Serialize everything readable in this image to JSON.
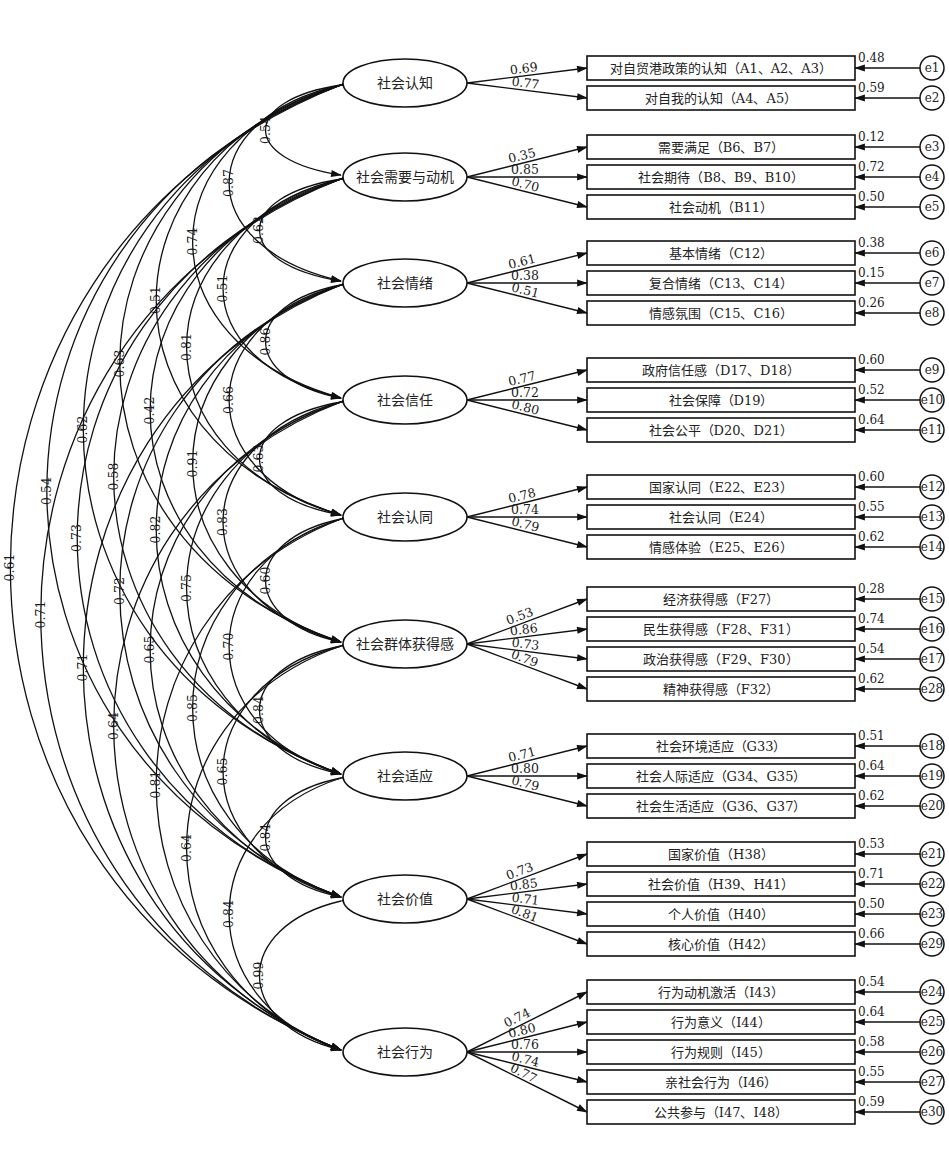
{
  "latent_factors": [
    {
      "id": "F1",
      "label": "社会认知"
    },
    {
      "id": "F2",
      "label": "社会需要与动机"
    },
    {
      "id": "F3",
      "label": "社会情绪"
    },
    {
      "id": "F4",
      "label": "社会信任"
    },
    {
      "id": "F5",
      "label": "社会认同"
    },
    {
      "id": "F6",
      "label": "社会群体获得感"
    },
    {
      "id": "F7",
      "label": "社会适应"
    },
    {
      "id": "F8",
      "label": "社会价值"
    },
    {
      "id": "F9",
      "label": "社会行为"
    }
  ],
  "indicators": [
    {
      "factor": "F1",
      "label": "对自贸港政策的认知（A1、A2、A3）",
      "loading": "0.69",
      "error": "e1",
      "error_value": "0.48"
    },
    {
      "factor": "F1",
      "label": "对自我的认知（A4、A5）",
      "loading": "0.77",
      "error": "e2",
      "error_value": "0.59"
    },
    {
      "factor": "F2",
      "label": "需要满足（B6、B7）",
      "loading": "0.35",
      "error": "e3",
      "error_value": "0.12"
    },
    {
      "factor": "F2",
      "label": "社会期待（B8、B9、B10）",
      "loading": "0.85",
      "error": "e4",
      "error_value": "0.72"
    },
    {
      "factor": "F2",
      "label": "社会动机（B11）",
      "loading": "0.70",
      "error": "e5",
      "error_value": "0.50"
    },
    {
      "factor": "F3",
      "label": "基本情绪（C12）",
      "loading": "0.61",
      "error": "e6",
      "error_value": "0.38"
    },
    {
      "factor": "F3",
      "label": "复合情绪（C13、C14）",
      "loading": "0.38",
      "error": "e7",
      "error_value": "0.15"
    },
    {
      "factor": "F3",
      "label": "情感氛围（C15、C16）",
      "loading": "0.51",
      "error": "e8",
      "error_value": "0.26"
    },
    {
      "factor": "F4",
      "label": "政府信任感（D17、D18）",
      "loading": "0.77",
      "error": "e9",
      "error_value": "0.60"
    },
    {
      "factor": "F4",
      "label": "社会保障（D19）",
      "loading": "0.72",
      "error": "e10",
      "error_value": "0.52"
    },
    {
      "factor": "F4",
      "label": "社会公平（D20、D21）",
      "loading": "0.80",
      "error": "e11",
      "error_value": "0.64"
    },
    {
      "factor": "F5",
      "label": "国家认同（E22、E23）",
      "loading": "0.78",
      "error": "e12",
      "error_value": "0.60"
    },
    {
      "factor": "F5",
      "label": "社会认同（E24）",
      "loading": "0.74",
      "error": "e13",
      "error_value": "0.55"
    },
    {
      "factor": "F5",
      "label": "情感体验（E25、E26）",
      "loading": "0.79",
      "error": "e14",
      "error_value": "0.62"
    },
    {
      "factor": "F6",
      "label": "经济获得感（F27）",
      "loading": "0.53",
      "error": "e15",
      "error_value": "0.28"
    },
    {
      "factor": "F6",
      "label": "民生获得感（F28、F31）",
      "loading": "0.86",
      "error": "e16",
      "error_value": "0.74"
    },
    {
      "factor": "F6",
      "label": "政治获得感（F29、F30）",
      "loading": "0.73",
      "error": "e17",
      "error_value": "0.54"
    },
    {
      "factor": "F6",
      "label": "精神获得感（F32）",
      "loading": "0.79",
      "error": "e28",
      "error_value": "0.62"
    },
    {
      "factor": "F7",
      "label": "社会环境适应（G33）",
      "loading": "0.71",
      "error": "e18",
      "error_value": "0.51"
    },
    {
      "factor": "F7",
      "label": "社会人际适应（G34、G35）",
      "loading": "0.80",
      "error": "e19",
      "error_value": "0.64"
    },
    {
      "factor": "F7",
      "label": "社会生活适应（G36、G37）",
      "loading": "0.79",
      "error": "e20",
      "error_value": "0.62"
    },
    {
      "factor": "F8",
      "label": "国家价值（H38）",
      "loading": "0.73",
      "error": "e21",
      "error_value": "0.53"
    },
    {
      "factor": "F8",
      "label": "社会价值（H39、H41）",
      "loading": "0.85",
      "error": "e22",
      "error_value": "0.71"
    },
    {
      "factor": "F8",
      "label": "个人价值（H40）",
      "loading": "0.71",
      "error": "e23",
      "error_value": "0.50"
    },
    {
      "factor": "F8",
      "label": "核心价值（H42）",
      "loading": "0.81",
      "error": "e29",
      "error_value": "0.66"
    },
    {
      "factor": "F9",
      "label": "行为动机激活（I43）",
      "loading": "0.74",
      "error": "e24",
      "error_value": "0.54"
    },
    {
      "factor": "F9",
      "label": "行为意义（I44）",
      "loading": "0.80",
      "error": "e25",
      "error_value": "0.64"
    },
    {
      "factor": "F9",
      "label": "行为规则（I45）",
      "loading": "0.76",
      "error": "e26",
      "error_value": "0.58"
    },
    {
      "factor": "F9",
      "label": "亲社会行为（I46）",
      "loading": "0.74",
      "error": "e27",
      "error_value": "0.55"
    },
    {
      "factor": "F9",
      "label": "公共参与（I47、I48）",
      "loading": "0.77",
      "error": "e30",
      "error_value": "0.59"
    }
  ],
  "correlations": [
    {
      "from": "F1",
      "to": "F2",
      "value": "0.54"
    },
    {
      "from": "F2",
      "to": "F3",
      "value": "0.62"
    },
    {
      "from": "F3",
      "to": "F4",
      "value": "0.86"
    },
    {
      "from": "F4",
      "to": "F5",
      "value": "0.63"
    },
    {
      "from": "F5",
      "to": "F6",
      "value": "0.60"
    },
    {
      "from": "F6",
      "to": "F7",
      "value": "0.84"
    },
    {
      "from": "F7",
      "to": "F8",
      "value": "0.84"
    },
    {
      "from": "F8",
      "to": "F9",
      "value": "0.99"
    },
    {
      "from": "F1",
      "to": "F3",
      "value": "0.87"
    },
    {
      "from": "F2",
      "to": "F4",
      "value": "0.51"
    },
    {
      "from": "F3",
      "to": "F5",
      "value": "0.66"
    },
    {
      "from": "F4",
      "to": "F6",
      "value": "0.83"
    },
    {
      "from": "F5",
      "to": "F7",
      "value": "0.70"
    },
    {
      "from": "F6",
      "to": "F8",
      "value": "0.65"
    },
    {
      "from": "F7",
      "to": "F9",
      "value": "0.84"
    },
    {
      "from": "F1",
      "to": "F4",
      "value": "0.74"
    },
    {
      "from": "F2",
      "to": "F5",
      "value": "0.81"
    },
    {
      "from": "F3",
      "to": "F6",
      "value": "0.91"
    },
    {
      "from": "F4",
      "to": "F7",
      "value": "0.75"
    },
    {
      "from": "F5",
      "to": "F8",
      "value": "0.85"
    },
    {
      "from": "F6",
      "to": "F9",
      "value": "0.64"
    },
    {
      "from": "F1",
      "to": "F5",
      "value": "0.51"
    },
    {
      "from": "F2",
      "to": "F6",
      "value": "0.42"
    },
    {
      "from": "F3",
      "to": "F7",
      "value": "0.82"
    },
    {
      "from": "F4",
      "to": "F8",
      "value": "0.65"
    },
    {
      "from": "F5",
      "to": "F9",
      "value": "0.81"
    },
    {
      "from": "F1",
      "to": "F6",
      "value": "0.63"
    },
    {
      "from": "F2",
      "to": "F7",
      "value": "0.58"
    },
    {
      "from": "F3",
      "to": "F8",
      "value": "0.72"
    },
    {
      "from": "F4",
      "to": "F9",
      "value": "0.64"
    },
    {
      "from": "F1",
      "to": "F7",
      "value": "0.62"
    },
    {
      "from": "F2",
      "to": "F8",
      "value": "0.73"
    },
    {
      "from": "F3",
      "to": "F9",
      "value": "0.71"
    },
    {
      "from": "F1",
      "to": "F8",
      "value": "0.54"
    },
    {
      "from": "F2",
      "to": "F9",
      "value": "0.71"
    },
    {
      "from": "F1",
      "to": "F9",
      "value": "0.61"
    }
  ]
}
